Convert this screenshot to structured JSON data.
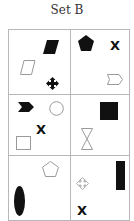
{
  "title": "Set B",
  "grid": {
    "rows": 3,
    "cols": 2,
    "cells": [
      {
        "position": "row1-col1",
        "shapes": [
          "black-parallelogram",
          "white-parallelogram",
          "black-four-way-arrow"
        ]
      },
      {
        "position": "row1-col2",
        "shapes": [
          "black-pentagon",
          "x-mark",
          "white-tag-pentagon"
        ]
      },
      {
        "position": "row2-col1",
        "shapes": [
          "black-chevron-arrow",
          "white-circle",
          "x-mark",
          "white-square"
        ]
      },
      {
        "position": "row2-col2",
        "shapes": [
          "black-square",
          "white-hourglass"
        ]
      },
      {
        "position": "row3-col1",
        "shapes": [
          "white-pentagon",
          "black-ellipse"
        ]
      },
      {
        "position": "row3-col2",
        "shapes": [
          "white-four-way-arrow",
          "black-rectangle",
          "x-mark"
        ]
      }
    ],
    "x_label": "X"
  },
  "colors": {
    "fill_dark": "#111111",
    "outline": "#9a9a9a",
    "border": "#b8b8b8"
  }
}
